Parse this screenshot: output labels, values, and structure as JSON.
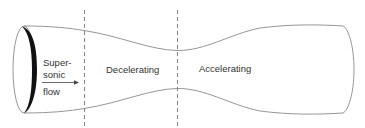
{
  "diagram": {
    "type": "converging-diverging nozzle",
    "inlet_label_lines": [
      "Super-",
      "sonic",
      "flow"
    ],
    "regions": [
      {
        "label": "Decelerating"
      },
      {
        "label": "Accelerating"
      }
    ],
    "colors": {
      "wall": "#8a8a8a",
      "divider": "#777777",
      "inlet_rim": "#111111",
      "text": "#333333",
      "background": "#ffffff"
    }
  }
}
